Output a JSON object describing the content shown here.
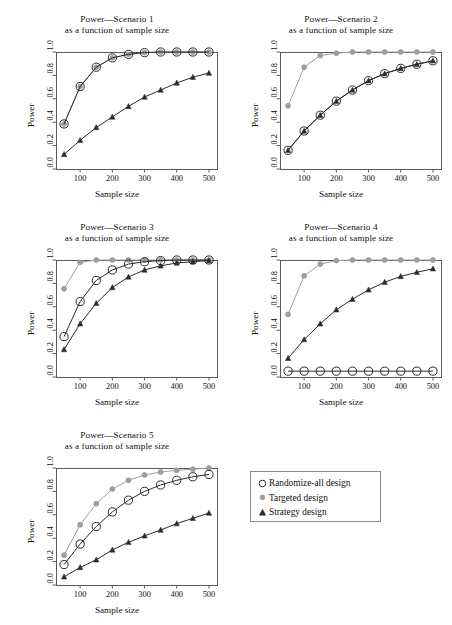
{
  "figure": {
    "series_styles": {
      "randomize": {
        "color": "#2b2b2b",
        "marker": "open-circle"
      },
      "targeted": {
        "color": "#9e9e9e",
        "marker": "filled-circle"
      },
      "strategy": {
        "color": "#2b2b2b",
        "marker": "filled-triangle"
      }
    }
  },
  "legend": {
    "name": "design-legend",
    "items": [
      {
        "key": "randomize",
        "label": "Randomize-all design",
        "marker": "open-circle",
        "color": "#2b2b2b"
      },
      {
        "key": "targeted",
        "label": "Targeted design",
        "marker": "filled-circle",
        "color": "#9e9e9e"
      },
      {
        "key": "strategy",
        "label": "Strategy design",
        "marker": "filled-triangle",
        "color": "#2b2b2b"
      }
    ]
  },
  "chart_data": [
    {
      "type": "line",
      "id": "scenario-1",
      "title": "Power—Scenario 1",
      "subtitle": "as a function of sample size",
      "xlabel": "Sample size",
      "ylabel": "Power",
      "x": [
        50,
        100,
        150,
        200,
        250,
        300,
        350,
        400,
        450,
        500
      ],
      "xlim": [
        25,
        525
      ],
      "ylim": [
        0.0,
        1.0
      ],
      "xticks": [
        100,
        200,
        300,
        400,
        500
      ],
      "yticks": [
        0.0,
        0.2,
        0.4,
        0.6,
        0.8,
        1.0
      ],
      "ytick_labels": [
        "0.0",
        "0.2",
        "0.4",
        "0.6",
        "0.8",
        "1.0"
      ],
      "grid": false,
      "series": [
        {
          "name": "Randomize-all design",
          "key": "randomize",
          "values": [
            0.385,
            0.705,
            0.87,
            0.95,
            0.98,
            0.995,
            1.0,
            1.0,
            1.0,
            1.0
          ]
        },
        {
          "name": "Targeted design",
          "key": "targeted",
          "values": [
            0.385,
            0.705,
            0.87,
            0.95,
            0.98,
            0.995,
            1.0,
            1.0,
            1.0,
            1.0
          ]
        },
        {
          "name": "Strategy design",
          "key": "strategy",
          "values": [
            0.125,
            0.245,
            0.355,
            0.445,
            0.535,
            0.615,
            0.675,
            0.735,
            0.785,
            0.82
          ]
        }
      ]
    },
    {
      "type": "line",
      "id": "scenario-2",
      "title": "Power—Scenario 2",
      "subtitle": "as a function of sample size",
      "xlabel": "Sample size",
      "ylabel": "Power",
      "x": [
        50,
        100,
        150,
        200,
        250,
        300,
        350,
        400,
        450,
        500
      ],
      "xlim": [
        25,
        525
      ],
      "ylim": [
        0.0,
        1.0
      ],
      "xticks": [
        100,
        200,
        300,
        400,
        500
      ],
      "yticks": [
        0.0,
        0.2,
        0.4,
        0.6,
        0.8,
        1.0
      ],
      "ytick_labels": [
        "0.0",
        "0.2",
        "0.4",
        "0.6",
        "0.8",
        "1.0"
      ],
      "grid": false,
      "series": [
        {
          "name": "Randomize-all design",
          "key": "randomize",
          "values": [
            0.16,
            0.325,
            0.46,
            0.58,
            0.675,
            0.755,
            0.815,
            0.86,
            0.895,
            0.925
          ]
        },
        {
          "name": "Targeted design",
          "key": "targeted",
          "values": [
            0.54,
            0.87,
            0.97,
            0.99,
            1.0,
            1.0,
            1.0,
            1.0,
            1.0,
            1.0
          ]
        },
        {
          "name": "Strategy design",
          "key": "strategy",
          "values": [
            0.16,
            0.325,
            0.46,
            0.58,
            0.675,
            0.755,
            0.815,
            0.86,
            0.895,
            0.925
          ]
        }
      ]
    },
    {
      "type": "line",
      "id": "scenario-3",
      "title": "Power—Scenario 3",
      "subtitle": "as a function of sample size",
      "xlabel": "Sample size",
      "ylabel": "Power",
      "x": [
        50,
        100,
        150,
        200,
        250,
        300,
        350,
        400,
        450,
        500
      ],
      "xlim": [
        25,
        525
      ],
      "ylim": [
        0.0,
        1.0
      ],
      "xticks": [
        100,
        200,
        300,
        400,
        500
      ],
      "yticks": [
        0.0,
        0.2,
        0.4,
        0.6,
        0.8,
        1.0
      ],
      "ytick_labels": [
        "0.0",
        "0.2",
        "0.4",
        "0.6",
        "0.8",
        "1.0"
      ],
      "grid": false,
      "series": [
        {
          "name": "Randomize-all design",
          "key": "randomize",
          "values": [
            0.345,
            0.645,
            0.825,
            0.915,
            0.965,
            0.985,
            0.995,
            1.0,
            1.0,
            1.0
          ]
        },
        {
          "name": "Targeted design",
          "key": "targeted",
          "values": [
            0.755,
            0.98,
            1.0,
            1.0,
            1.0,
            1.0,
            1.0,
            1.0,
            1.0,
            1.0
          ]
        },
        {
          "name": "Strategy design",
          "key": "strategy",
          "values": [
            0.235,
            0.455,
            0.63,
            0.765,
            0.855,
            0.915,
            0.95,
            0.975,
            0.985,
            0.995
          ]
        }
      ]
    },
    {
      "type": "line",
      "id": "scenario-4",
      "title": "Power—Scenario 4",
      "subtitle": "as a function of sample size",
      "xlabel": "Sample size",
      "ylabel": "Power",
      "x": [
        50,
        100,
        150,
        200,
        250,
        300,
        350,
        400,
        450,
        500
      ],
      "xlim": [
        25,
        525
      ],
      "ylim": [
        0.0,
        1.0
      ],
      "xticks": [
        100,
        200,
        300,
        400,
        500
      ],
      "yticks": [
        0.0,
        0.2,
        0.4,
        0.6,
        0.8,
        1.0
      ],
      "ytick_labels": [
        "0.0",
        "0.2",
        "0.4",
        "0.6",
        "0.8",
        "1.0"
      ],
      "grid": false,
      "series": [
        {
          "name": "Randomize-all design",
          "key": "randomize",
          "values": [
            0.05,
            0.05,
            0.05,
            0.05,
            0.05,
            0.05,
            0.05,
            0.05,
            0.05,
            0.05
          ]
        },
        {
          "name": "Targeted design",
          "key": "targeted",
          "values": [
            0.535,
            0.865,
            0.965,
            0.995,
            1.0,
            1.0,
            1.0,
            1.0,
            1.0,
            1.0
          ]
        },
        {
          "name": "Strategy design",
          "key": "strategy",
          "values": [
            0.16,
            0.32,
            0.455,
            0.575,
            0.665,
            0.745,
            0.81,
            0.86,
            0.895,
            0.925
          ]
        }
      ]
    },
    {
      "type": "line",
      "id": "scenario-5",
      "title": "Power—Scenario 5",
      "subtitle": "as a function of sample size",
      "xlabel": "Sample size",
      "ylabel": "Power",
      "x": [
        50,
        100,
        150,
        200,
        250,
        300,
        350,
        400,
        450,
        500
      ],
      "xlim": [
        25,
        525
      ],
      "ylim": [
        0.0,
        1.0
      ],
      "xticks": [
        100,
        200,
        300,
        400,
        500
      ],
      "yticks": [
        0.0,
        0.2,
        0.4,
        0.6,
        0.8,
        1.0
      ],
      "ytick_labels": [
        "0.0",
        "0.2",
        "0.4",
        "0.6",
        "0.8",
        "1.0"
      ],
      "grid": false,
      "series": [
        {
          "name": "Randomize-all design",
          "key": "randomize",
          "values": [
            0.175,
            0.35,
            0.5,
            0.625,
            0.725,
            0.8,
            0.855,
            0.895,
            0.925,
            0.945
          ]
        },
        {
          "name": "Targeted design",
          "key": "targeted",
          "values": [
            0.255,
            0.515,
            0.695,
            0.82,
            0.895,
            0.94,
            0.965,
            0.98,
            0.99,
            1.0
          ]
        },
        {
          "name": "Strategy design",
          "key": "strategy",
          "values": [
            0.07,
            0.15,
            0.215,
            0.3,
            0.365,
            0.42,
            0.47,
            0.525,
            0.57,
            0.615
          ]
        }
      ]
    }
  ]
}
